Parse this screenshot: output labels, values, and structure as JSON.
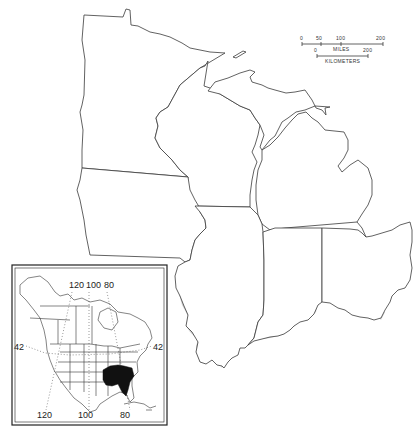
{
  "map": {
    "title": "",
    "regions_outlined": [
      "Minnesota",
      "Wisconsin",
      "Michigan",
      "Iowa",
      "Illinois",
      "Indiana",
      "Ohio"
    ],
    "shaded_range": {
      "description": "Distribution range shown in gray across southern Illinois, southern Indiana, and southern Ohio",
      "fill_color": "#c8c8c8"
    },
    "scale_bar": {
      "miles_ticks": [
        "0",
        "50",
        "100",
        "200"
      ],
      "miles_label": "MILES",
      "km_ticks": [
        "0",
        "200"
      ],
      "km_label": "KILOMETERS"
    }
  },
  "inset": {
    "description": "Locator map of North America with range shown in black over southeastern United States",
    "top_longitude_labels": [
      "120",
      "100",
      "80"
    ],
    "bottom_longitude_labels": [
      "120",
      "100",
      "80"
    ],
    "left_latitude_label": "42",
    "right_latitude_label": "42",
    "range_fill_color": "#111111"
  }
}
